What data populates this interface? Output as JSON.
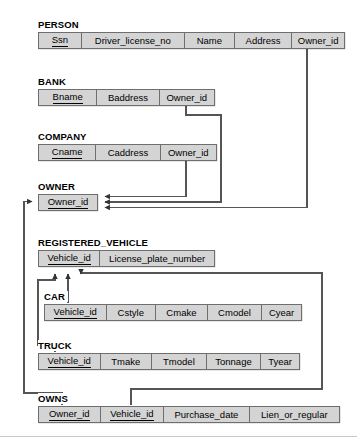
{
  "diagram": {
    "background_color": "#ffffff",
    "box_fill_color": "#d4d4d4",
    "box_border_color": "#6e6e6e",
    "connector_color": "#555555"
  },
  "relations": [
    {
      "name": "PERSON",
      "columns": [
        {
          "label": "Ssn",
          "primary_key": true
        },
        {
          "label": "Driver_license_no",
          "primary_key": false
        },
        {
          "label": "Name",
          "primary_key": false
        },
        {
          "label": "Address",
          "primary_key": false
        },
        {
          "label": "Owner_id",
          "primary_key": false
        }
      ]
    },
    {
      "name": "BANK",
      "columns": [
        {
          "label": "Bname",
          "primary_key": true
        },
        {
          "label": "Baddress",
          "primary_key": false
        },
        {
          "label": "Owner_id",
          "primary_key": false
        }
      ]
    },
    {
      "name": "COMPANY",
      "columns": [
        {
          "label": "Cname",
          "primary_key": true
        },
        {
          "label": "Caddress",
          "primary_key": false
        },
        {
          "label": "Owner_id",
          "primary_key": false
        }
      ]
    },
    {
      "name": "OWNER",
      "columns": [
        {
          "label": "Owner_id",
          "primary_key": true
        }
      ]
    },
    {
      "name": "REGISTERED_VEHICLE",
      "columns": [
        {
          "label": "Vehicle_id",
          "primary_key": true
        },
        {
          "label": "License_plate_number",
          "primary_key": false
        }
      ]
    },
    {
      "name": "CAR",
      "columns": [
        {
          "label": "Vehicle_id",
          "primary_key": true
        },
        {
          "label": "Cstyle",
          "primary_key": false
        },
        {
          "label": "Cmake",
          "primary_key": false
        },
        {
          "label": "Cmodel",
          "primary_key": false
        },
        {
          "label": "Cyear",
          "primary_key": false
        }
      ]
    },
    {
      "name": "TRUCK",
      "columns": [
        {
          "label": "Vehicle_id",
          "primary_key": true
        },
        {
          "label": "Tmake",
          "primary_key": false
        },
        {
          "label": "Tmodel",
          "primary_key": false
        },
        {
          "label": "Tonnage",
          "primary_key": false
        },
        {
          "label": "Tyear",
          "primary_key": false
        }
      ]
    },
    {
      "name": "OWNS",
      "columns": [
        {
          "label": "Owner_id",
          "primary_key": true
        },
        {
          "label": "Vehicle_id",
          "primary_key": true
        },
        {
          "label": "Purchase_date",
          "primary_key": false
        },
        {
          "label": "Lien_or_regular",
          "primary_key": false
        }
      ]
    }
  ],
  "foreign_keys": [
    {
      "from_relation": "PERSON",
      "from_column": "Owner_id",
      "to_relation": "OWNER",
      "to_column": "Owner_id"
    },
    {
      "from_relation": "BANK",
      "from_column": "Owner_id",
      "to_relation": "OWNER",
      "to_column": "Owner_id"
    },
    {
      "from_relation": "COMPANY",
      "from_column": "Owner_id",
      "to_relation": "OWNER",
      "to_column": "Owner_id"
    },
    {
      "from_relation": "OWNS",
      "from_column": "Owner_id",
      "to_relation": "OWNER",
      "to_column": "Owner_id"
    },
    {
      "from_relation": "CAR",
      "from_column": "Vehicle_id",
      "to_relation": "REGISTERED_VEHICLE",
      "to_column": "Vehicle_id"
    },
    {
      "from_relation": "TRUCK",
      "from_column": "Vehicle_id",
      "to_relation": "REGISTERED_VEHICLE",
      "to_column": "Vehicle_id"
    },
    {
      "from_relation": "OWNS",
      "from_column": "Vehicle_id",
      "to_relation": "REGISTERED_VEHICLE",
      "to_column": "Vehicle_id"
    }
  ]
}
